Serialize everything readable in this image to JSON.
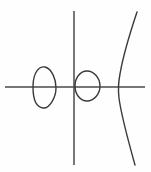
{
  "figure": {
    "title": "Plane curves with coordinate axes",
    "background_color": "#fefefe",
    "width": 151,
    "height": 172,
    "axis_color": "#4a4a4a",
    "curve_color": "#3a3a3a",
    "origin": {
      "x": 74,
      "y": 87
    }
  },
  "axes": {
    "x_axis": {
      "label": "x-axis",
      "x_start": 5,
      "x_end": 145,
      "y": 87
    },
    "y_axis": {
      "label": "y-axis",
      "x": 74,
      "y_start": 11,
      "y_end": 165
    }
  },
  "chart_data": {
    "type": "line",
    "title": "Plane curves with coordinate axes",
    "xlabel": "",
    "ylabel": "",
    "grid": false,
    "legend": "none",
    "xlim": [
      5,
      145
    ],
    "ylim": [
      165,
      11
    ],
    "origin_px": [
      74,
      87
    ],
    "series": [
      {
        "name": "left-teardrop-loop",
        "shape": "closed-loop",
        "description": "Teardrop shaped closed oval left of the y-axis, crossing the x-axis; pointed/flat on the left, bulging to the right",
        "bbox_px": {
          "left": 31,
          "top": 66,
          "right": 56,
          "bottom": 109
        },
        "x_axis_crossings_px": [
          31,
          56
        ],
        "path": "M 33 87 C 33 71, 40 66, 45 67 C 52 69, 56 79, 56 88 C 56 98, 49 109, 43 108 C 36 107, 33 98, 33 87 Z"
      },
      {
        "name": "center-circle",
        "shape": "closed-loop",
        "description": "Small circle straddling the y-axis and the x-axis, slightly right of the origin",
        "bbox_px": {
          "left": 75,
          "top": 71,
          "right": 100,
          "bottom": 101
        },
        "center_px": [
          87,
          86
        ],
        "radius_px": [
          12.5,
          15
        ],
        "path": "M 87 71 C 94 71, 100 78, 100 86 C 100 94, 94 101, 87 101 C 80 101, 75 94, 75 86 C 75 78, 80 71, 87 71 Z"
      },
      {
        "name": "right-s-curve",
        "shape": "open-curve",
        "description": "S-shaped (cubic-like) curve crossing the x-axis near x=120, running from the top right down to the bottom right",
        "bbox_px": {
          "left": 118,
          "top": 12,
          "right": 138,
          "bottom": 165
        },
        "x_axis_crossing_px": 120,
        "endpoint_top_px": [
          137,
          12
        ],
        "endpoint_bottom_px": [
          135,
          165
        ],
        "path": "M 137 12 C 129 36, 123 56, 120 74 C 118 84, 118 90, 119 98 C 121 114, 128 140, 135 165"
      }
    ]
  }
}
